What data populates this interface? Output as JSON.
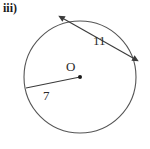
{
  "figure": {
    "part_label": "iii)",
    "type": "circle-with-chord-and-radius",
    "background_color": "#ffffff",
    "stroke_color": "#4a4a4a",
    "text_color": "#2b2b2b",
    "circle": {
      "center_x": 80,
      "center_y": 77,
      "radius": 56,
      "center_dot_label": "O",
      "center_dot_radius": 2
    },
    "chord": {
      "label": "11",
      "start_x": 64,
      "start_y": 19,
      "end_x": 133,
      "end_y": 58,
      "arrowheads": "both-ends"
    },
    "radius_segment": {
      "label": "7",
      "start_x": 80,
      "start_y": 77,
      "end_x": 26,
      "end_y": 88,
      "arrowheads": "none"
    }
  }
}
